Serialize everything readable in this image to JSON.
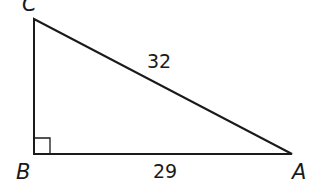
{
  "diagram": {
    "type": "right-triangle",
    "vertices": [
      {
        "id": "C",
        "label": "C"
      },
      {
        "id": "B",
        "label": "B"
      },
      {
        "id": "A",
        "label": "A"
      }
    ],
    "right_angle_at": "B",
    "sides": {
      "hypotenuse_CA": "32",
      "base_BA": "29"
    },
    "stroke_color": "#1a1a1a"
  }
}
